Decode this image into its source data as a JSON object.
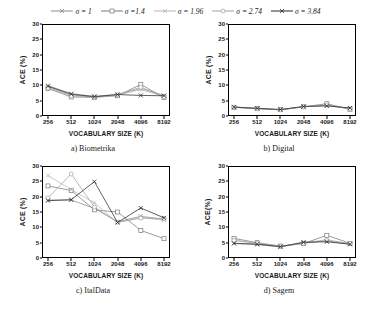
{
  "figure": {
    "legend_position": "top-center",
    "series_labels": [
      "σ = 1",
      "σ =1.4",
      "σ = 1.96",
      "σ = 2.74",
      "σ = 3.84"
    ],
    "colors": [
      "#8c8c8c",
      "#7a7a7a",
      "#b5b5b5",
      "#a0a0a0",
      "#2b2b2b"
    ],
    "markers": [
      "x",
      "square",
      "x",
      "circle",
      "x"
    ]
  },
  "chart_data": [
    {
      "type": "line",
      "title": "a) Biometrika",
      "xlabel": "VOCABULARY SIZE (K)",
      "ylabel": "ACE (%)",
      "categories": [
        "256",
        "512",
        "1024",
        "2048",
        "4096",
        "8192"
      ],
      "ylim": [
        0,
        30
      ],
      "yticks": [
        0,
        5,
        10,
        15,
        20,
        25,
        30
      ],
      "grid": false,
      "series": [
        {
          "name": "σ = 1",
          "values": [
            9.9,
            7.3,
            6.4,
            7.0,
            9.0,
            6.7
          ]
        },
        {
          "name": "σ =1.4",
          "values": [
            9.0,
            6.2,
            6.1,
            6.6,
            10.3,
            6.0
          ]
        },
        {
          "name": "σ = 1.96",
          "values": [
            9.4,
            6.9,
            6.2,
            6.8,
            8.6,
            6.4
          ]
        },
        {
          "name": "σ = 2.74",
          "values": [
            9.2,
            6.6,
            6.2,
            6.9,
            9.4,
            6.3
          ]
        },
        {
          "name": "σ = 3.84",
          "values": [
            9.7,
            7.1,
            6.3,
            7.0,
            6.7,
            6.6
          ]
        }
      ]
    },
    {
      "type": "line",
      "title": "b) Digital",
      "xlabel": "VOCABULARY SIZE (K)",
      "ylabel": "ACE (%)",
      "categories": [
        "256",
        "512",
        "1024",
        "2048",
        "4096",
        "8192"
      ],
      "ylim": [
        0,
        30
      ],
      "yticks": [
        0,
        5,
        10,
        15,
        20,
        25,
        30
      ],
      "grid": false,
      "series": [
        {
          "name": "σ = 1",
          "values": [
            2.9,
            2.5,
            2.0,
            3.0,
            3.4,
            2.5
          ]
        },
        {
          "name": "σ =1.4",
          "values": [
            2.8,
            2.4,
            2.1,
            3.0,
            4.0,
            2.2
          ]
        },
        {
          "name": "σ = 1.96",
          "values": [
            3.0,
            2.5,
            2.0,
            3.1,
            3.5,
            2.4
          ]
        },
        {
          "name": "σ = 2.74",
          "values": [
            2.9,
            2.4,
            2.0,
            3.0,
            3.6,
            2.3
          ]
        },
        {
          "name": "σ = 3.84",
          "values": [
            2.9,
            2.5,
            2.1,
            3.1,
            3.3,
            2.6
          ]
        }
      ]
    },
    {
      "type": "line",
      "title": "c) ItalData",
      "xlabel": "VOCABULARY SIZE (K)",
      "ylabel": "ACE (%)",
      "categories": [
        "256",
        "512",
        "1024",
        "2048",
        "4096",
        "8192"
      ],
      "ylim": [
        0,
        30
      ],
      "yticks": [
        0,
        5,
        10,
        15,
        20,
        25,
        30
      ],
      "grid": false,
      "series": [
        {
          "name": "σ = 1",
          "values": [
            18.9,
            18.9,
            16.2,
            11.8,
            13.6,
            12.6
          ]
        },
        {
          "name": "σ =1.4",
          "values": [
            23.5,
            22.0,
            15.7,
            15.0,
            9.0,
            6.3
          ]
        },
        {
          "name": "σ = 1.96",
          "values": [
            26.9,
            22.3,
            18.0,
            11.5,
            13.2,
            12.3
          ]
        },
        {
          "name": "σ = 2.74",
          "values": [
            19.6,
            27.4,
            16.6,
            11.7,
            13.0,
            12.9
          ]
        },
        {
          "name": "σ = 3.84",
          "values": [
            18.7,
            19.0,
            24.9,
            11.6,
            16.3,
            13.1
          ]
        }
      ]
    },
    {
      "type": "line",
      "title": "d) Sagem",
      "xlabel": "VOCABULARY SIZE (K)",
      "ylabel": "ACE(%)",
      "categories": [
        "256",
        "512",
        "1024",
        "2048",
        "4096",
        "8192"
      ],
      "ylim": [
        0,
        30
      ],
      "yticks": [
        0,
        5,
        10,
        15,
        20,
        25,
        30
      ],
      "grid": false,
      "series": [
        {
          "name": "σ = 1",
          "values": [
            4.7,
            4.4,
            3.6,
            5.2,
            5.5,
            4.5
          ]
        },
        {
          "name": "σ =1.4",
          "values": [
            6.4,
            5.0,
            3.9,
            4.7,
            7.4,
            4.8
          ]
        },
        {
          "name": "σ = 1.96",
          "values": [
            6.0,
            4.8,
            3.8,
            4.9,
            6.0,
            4.6
          ]
        },
        {
          "name": "σ = 2.74",
          "values": [
            5.7,
            4.7,
            3.7,
            4.8,
            5.7,
            4.7
          ]
        },
        {
          "name": "σ = 3.84",
          "values": [
            4.8,
            4.5,
            3.7,
            5.1,
            5.3,
            4.5
          ]
        }
      ]
    }
  ]
}
